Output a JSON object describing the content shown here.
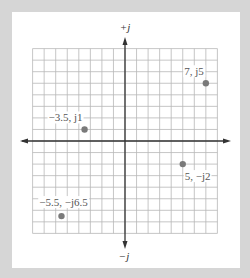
{
  "chart_data": {
    "type": "scatter",
    "title": "",
    "xlabel": "",
    "ylabel": "",
    "axis_labels": {
      "positive_imag": "+j",
      "negative_imag": "−j"
    },
    "xlim": [
      -8,
      8
    ],
    "ylim": [
      -8,
      8
    ],
    "grid": true,
    "grid_step": 1,
    "points": [
      {
        "x": 7,
        "y": 5,
        "label": "7, j5",
        "label_pos": "upper-left"
      },
      {
        "x": -3.5,
        "y": 1,
        "label": "−3.5, j1",
        "label_pos": "upper-left"
      },
      {
        "x": 5,
        "y": -2,
        "label": "5, −j2",
        "label_pos": "lower-right"
      },
      {
        "x": -5.5,
        "y": -6.5,
        "label": "−5.5, −j6.5",
        "label_pos": "upper"
      }
    ]
  },
  "colors": {
    "background": "#d6d6d6",
    "panel": "#ffffff",
    "grid": "#b8b8b8",
    "axis": "#333333",
    "point": "#7a7a7a",
    "label": "#555555"
  }
}
